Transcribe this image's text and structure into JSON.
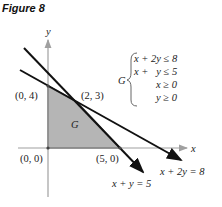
{
  "figure": {
    "title": "Figure 8",
    "axes": {
      "x_label": "x",
      "y_label": "y"
    },
    "region_label": "G",
    "vertices": [
      {
        "label": "(0, 0)",
        "x": 0,
        "y": 0
      },
      {
        "label": "(0, 4)",
        "x": 0,
        "y": 4
      },
      {
        "label": "(2, 3)",
        "x": 2,
        "y": 3
      },
      {
        "label": "(5, 0)",
        "x": 5,
        "y": 0
      }
    ],
    "lines": [
      {
        "label": "x + y = 5"
      },
      {
        "label": "x + 2y = 8"
      }
    ],
    "system": {
      "name": "G",
      "constraints": [
        "x + 2y ≤ 8",
        "x +   y ≤ 5",
        "x ≥ 0",
        "y ≥ 0"
      ]
    },
    "colors": {
      "region_fill": "#b3b3b3",
      "axis": "#a0a0a0",
      "line": "#111111",
      "boundary": "#555555"
    }
  }
}
